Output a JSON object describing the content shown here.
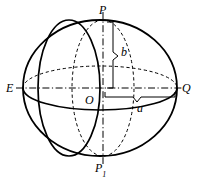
{
  "figure": {
    "type": "geometric-diagram",
    "width": 197,
    "height": 180,
    "background_color": "#ffffff",
    "stroke_color": "#000000",
    "labels": {
      "north_pole": "P",
      "south_pole_base": "P",
      "south_pole_subscript": "1",
      "west_point": "E",
      "east_point": "Q",
      "origin": "O",
      "semi_minor_axis": "b",
      "semi_major_axis": "a"
    },
    "geometry": {
      "center": {
        "x": 100,
        "y": 88
      },
      "outline_ellipse": {
        "rx": 77,
        "ry": 68,
        "style": "solid"
      },
      "equator_ellipse": {
        "rx": 77,
        "ry": 22,
        "upper_style": "dashed",
        "lower_style": "solid"
      },
      "front_meridian": {
        "rx": 31,
        "ry": 68,
        "style": "solid",
        "side": "left-of-center"
      },
      "back_meridian": {
        "rx": 31,
        "ry": 68,
        "style": "dashed",
        "side": "right-of-center"
      },
      "axis_horizontal": {
        "from": "E",
        "to": "Q",
        "style": "dash-dot"
      },
      "axis_vertical": {
        "from": "P",
        "to": "P1",
        "style": "dash-dot"
      },
      "brace_b": {
        "orientation": "vertical",
        "from_y": 22,
        "to_y": 90,
        "x": 106
      },
      "brace_a": {
        "orientation": "horizontal",
        "from_x": 105,
        "to_x": 175,
        "y": 97
      }
    }
  }
}
